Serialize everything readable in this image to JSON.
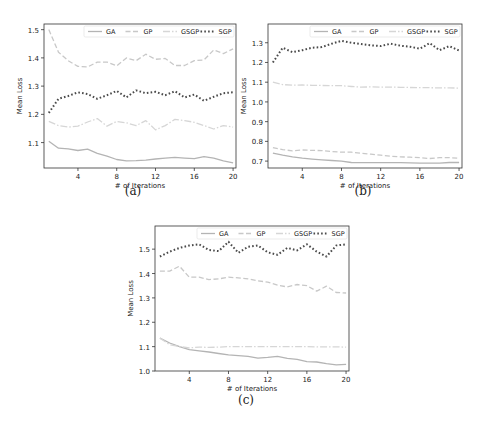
{
  "chart_data": [
    {
      "id": "a",
      "type": "line",
      "caption": "(a)",
      "title": "",
      "xlabel": "# of Iterations",
      "ylabel": "Mean Loss",
      "x": [
        1,
        2,
        3,
        4,
        5,
        6,
        7,
        8,
        9,
        10,
        11,
        12,
        13,
        14,
        15,
        16,
        17,
        18,
        19,
        20
      ],
      "xticks": [
        4,
        8,
        12,
        16,
        20
      ],
      "yticks": [
        1.1,
        1.2,
        1.3,
        1.4,
        1.5
      ],
      "ylim": [
        1.01,
        1.52
      ],
      "xlim": [
        0.5,
        20.3
      ],
      "legend": [
        "GA",
        "GP",
        "GSGP",
        "SGP"
      ],
      "legend_position": "upper right",
      "series": [
        {
          "name": "GA",
          "style": "solid",
          "color": "#b4b4b4",
          "values": [
            1.105,
            1.08,
            1.078,
            1.072,
            1.077,
            1.062,
            1.052,
            1.04,
            1.035,
            1.036,
            1.038,
            1.042,
            1.045,
            1.048,
            1.045,
            1.043,
            1.05,
            1.045,
            1.035,
            1.028
          ]
        },
        {
          "name": "GP",
          "style": "dashed",
          "color": "#c8c8c8",
          "values": [
            1.5,
            1.42,
            1.39,
            1.37,
            1.368,
            1.385,
            1.385,
            1.372,
            1.4,
            1.39,
            1.413,
            1.395,
            1.398,
            1.373,
            1.373,
            1.39,
            1.393,
            1.428,
            1.415,
            1.432
          ]
        },
        {
          "name": "GSGP",
          "style": "dashdot",
          "color": "#d6d6d6",
          "values": [
            1.175,
            1.16,
            1.155,
            1.158,
            1.173,
            1.185,
            1.158,
            1.175,
            1.17,
            1.16,
            1.178,
            1.145,
            1.16,
            1.182,
            1.178,
            1.172,
            1.16,
            1.148,
            1.16,
            1.155
          ]
        },
        {
          "name": "SGP",
          "style": "dotted",
          "color": "#4a4a4a",
          "values": [
            1.205,
            1.255,
            1.265,
            1.278,
            1.272,
            1.255,
            1.268,
            1.283,
            1.26,
            1.285,
            1.275,
            1.28,
            1.268,
            1.282,
            1.26,
            1.27,
            1.248,
            1.262,
            1.275,
            1.278
          ]
        }
      ]
    },
    {
      "id": "b",
      "type": "line",
      "caption": "(b)",
      "title": "",
      "xlabel": "# of Iterations",
      "ylabel": "Mean Loss",
      "x": [
        1,
        2,
        3,
        4,
        5,
        6,
        7,
        8,
        9,
        10,
        11,
        12,
        13,
        14,
        15,
        16,
        17,
        18,
        19,
        20
      ],
      "xticks": [
        4,
        8,
        12,
        16,
        20
      ],
      "yticks": [
        0.7,
        0.8,
        0.9,
        1.0,
        1.1,
        1.2,
        1.3
      ],
      "ylim": [
        0.665,
        1.395
      ],
      "xlim": [
        0.5,
        20.3
      ],
      "legend": [
        "GA",
        "GP",
        "GSGP",
        "SGP"
      ],
      "legend_position": "upper right",
      "series": [
        {
          "name": "GA",
          "style": "solid",
          "color": "#b4b4b4",
          "values": [
            0.74,
            0.73,
            0.722,
            0.715,
            0.71,
            0.706,
            0.703,
            0.7,
            0.693,
            0.692,
            0.692,
            0.692,
            0.692,
            0.692,
            0.691,
            0.69,
            0.69,
            0.69,
            0.693,
            0.693
          ]
        },
        {
          "name": "GP",
          "style": "dashed",
          "color": "#c8c8c8",
          "values": [
            0.768,
            0.758,
            0.752,
            0.756,
            0.754,
            0.753,
            0.748,
            0.745,
            0.745,
            0.74,
            0.735,
            0.73,
            0.725,
            0.722,
            0.72,
            0.717,
            0.713,
            0.717,
            0.717,
            0.714
          ]
        },
        {
          "name": "GSGP",
          "style": "dashdot",
          "color": "#d6d6d6",
          "values": [
            1.1,
            1.088,
            1.085,
            1.086,
            1.084,
            1.083,
            1.082,
            1.082,
            1.078,
            1.075,
            1.076,
            1.075,
            1.075,
            1.074,
            1.073,
            1.072,
            1.072,
            1.071,
            1.071,
            1.07
          ]
        },
        {
          "name": "SGP",
          "style": "dotted",
          "color": "#4a4a4a",
          "values": [
            1.2,
            1.275,
            1.252,
            1.262,
            1.275,
            1.278,
            1.295,
            1.31,
            1.3,
            1.293,
            1.287,
            1.283,
            1.295,
            1.285,
            1.28,
            1.27,
            1.298,
            1.262,
            1.283,
            1.26
          ]
        }
      ]
    },
    {
      "id": "c",
      "type": "line",
      "caption": "(c)",
      "title": "",
      "xlabel": "# of Iterations",
      "ylabel": "Mean Loss",
      "x": [
        1,
        2,
        3,
        4,
        5,
        6,
        7,
        8,
        9,
        10,
        11,
        12,
        13,
        14,
        15,
        16,
        17,
        18,
        19,
        20
      ],
      "xticks": [
        4,
        8,
        12,
        16,
        20
      ],
      "yticks": [
        1.0,
        1.1,
        1.2,
        1.3,
        1.4,
        1.5
      ],
      "ylim": [
        1.0,
        1.595
      ],
      "xlim": [
        0.5,
        20.3
      ],
      "legend": [
        "GA",
        "GP",
        "GSGP",
        "SGP"
      ],
      "legend_position": "upper right",
      "series": [
        {
          "name": "GA",
          "style": "solid",
          "color": "#b4b4b4",
          "values": [
            1.135,
            1.115,
            1.1,
            1.088,
            1.083,
            1.078,
            1.072,
            1.066,
            1.063,
            1.06,
            1.053,
            1.056,
            1.06,
            1.052,
            1.048,
            1.038,
            1.037,
            1.03,
            1.025,
            1.027
          ]
        },
        {
          "name": "GP",
          "style": "dashed",
          "color": "#c8c8c8",
          "values": [
            1.41,
            1.41,
            1.43,
            1.385,
            1.385,
            1.375,
            1.378,
            1.385,
            1.382,
            1.378,
            1.37,
            1.365,
            1.352,
            1.345,
            1.355,
            1.35,
            1.328,
            1.348,
            1.322,
            1.32
          ]
        },
        {
          "name": "GSGP",
          "style": "dashdot",
          "color": "#d6d6d6",
          "values": [
            1.135,
            1.108,
            1.1,
            1.095,
            1.098,
            1.097,
            1.098,
            1.1,
            1.1,
            1.1,
            1.1,
            1.1,
            1.1,
            1.1,
            1.1,
            1.1,
            1.099,
            1.099,
            1.099,
            1.098
          ]
        },
        {
          "name": "SGP",
          "style": "dotted",
          "color": "#4a4a4a",
          "values": [
            1.47,
            1.49,
            1.505,
            1.515,
            1.52,
            1.497,
            1.492,
            1.53,
            1.485,
            1.51,
            1.515,
            1.487,
            1.477,
            1.505,
            1.495,
            1.52,
            1.49,
            1.47,
            1.515,
            1.52
          ]
        }
      ]
    }
  ]
}
